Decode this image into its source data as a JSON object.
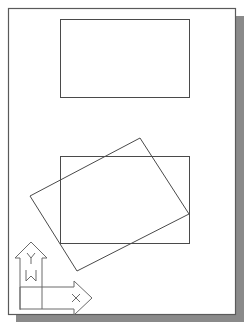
{
  "diagram": {
    "type": "cad-layout-sheet",
    "colors": {
      "background": "#ffffff",
      "sheet": "#ffffff",
      "sheet_border": "#5a5a5a",
      "shadow": "#8a8a8a",
      "line": "#4a4a4a",
      "ucs": "#6a6a6a"
    },
    "sheet": {
      "x": 8,
      "y": 8,
      "width": 227,
      "height": 306
    },
    "shadow": {
      "offset_x": 8,
      "offset_y": 8
    },
    "shapes": [
      {
        "name": "rectangle-top",
        "type": "rect",
        "x": 60,
        "y": 19,
        "width": 129,
        "height": 78
      },
      {
        "name": "rectangle-bottom",
        "type": "rect",
        "x": 60,
        "y": 156,
        "width": 129,
        "height": 87
      },
      {
        "name": "rectangle-rotated",
        "type": "polygon",
        "points": [
          [
            140,
            138
          ],
          [
            189,
            214
          ],
          [
            77,
            271
          ],
          [
            30,
            196
          ]
        ]
      }
    ],
    "ucs_icon": {
      "y_label": "Y",
      "x_label": "X",
      "w_label": "W"
    }
  }
}
